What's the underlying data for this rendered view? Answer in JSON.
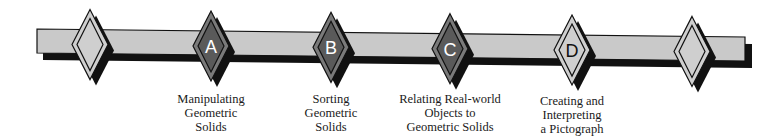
{
  "diagram": {
    "type": "timeline",
    "colors": {
      "bar_fill": "#c9c9c9",
      "bar_border": "#111111",
      "shadow": "#111111",
      "plain_diamond_fill": "#cfcfcf",
      "dark_diamond_outer": "#7a7a7a",
      "dark_diamond_inner": "#5a5a5a",
      "dark_letter": "#ffffff",
      "light_letter": "#111111"
    },
    "markers": [
      {
        "id": "start",
        "letter": "",
        "style": "plain",
        "x": 90
      },
      {
        "id": "A",
        "letter": "A",
        "style": "dark",
        "x": 211,
        "label": [
          "Manipulating",
          "Geometric",
          "Solids"
        ]
      },
      {
        "id": "B",
        "letter": "B",
        "style": "dark",
        "x": 331,
        "label": [
          "Sorting",
          "Geometric",
          "Solids"
        ]
      },
      {
        "id": "C",
        "letter": "C",
        "style": "dark",
        "x": 450,
        "label": [
          "Relating Real-world",
          "Objects to",
          "Geometric Solids"
        ]
      },
      {
        "id": "D",
        "letter": "D",
        "style": "light",
        "x": 572,
        "label": [
          "Creating and",
          "Interpreting",
          "a Pictograph"
        ]
      },
      {
        "id": "end",
        "letter": "",
        "style": "plain",
        "x": 692
      }
    ]
  }
}
